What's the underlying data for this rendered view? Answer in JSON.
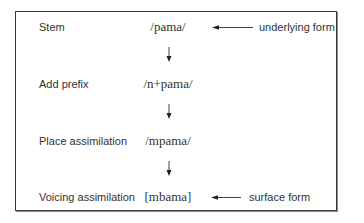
{
  "diagram": {
    "rows": [
      {
        "stage": "Stem",
        "form": "/pama/"
      },
      {
        "stage": "Add prefix",
        "form": "/n+pama/"
      },
      {
        "stage": "Place assimilation",
        "form": "/mpama/"
      },
      {
        "stage": "Voicing assimilation",
        "form": "[mbama]"
      }
    ],
    "annotations": {
      "underlying": "underlying form",
      "surface": "surface form"
    },
    "colors": {
      "border": "#3a3a3a",
      "text": "#333333",
      "arrow": "#222222"
    }
  }
}
